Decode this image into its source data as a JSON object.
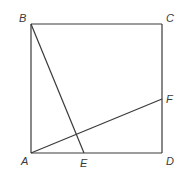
{
  "diagram": {
    "type": "geometry",
    "shape": "square",
    "stroke_color": "#3a3a3a",
    "background": "#ffffff",
    "points": {
      "A": {
        "label": "A",
        "x": 31,
        "y": 153,
        "label_x": 21,
        "label_y": 165
      },
      "B": {
        "label": "B",
        "x": 31,
        "y": 24,
        "label_x": 19,
        "label_y": 22
      },
      "C": {
        "label": "C",
        "x": 162,
        "y": 24,
        "label_x": 166,
        "label_y": 22
      },
      "D": {
        "label": "D",
        "x": 162,
        "y": 153,
        "label_x": 166,
        "label_y": 165
      },
      "E": {
        "label": "E",
        "x": 84,
        "y": 153,
        "label_x": 80,
        "label_y": 167
      },
      "F": {
        "label": "F",
        "x": 162,
        "y": 99,
        "label_x": 166,
        "label_y": 103
      }
    },
    "segments": [
      {
        "from": "A",
        "to": "B"
      },
      {
        "from": "B",
        "to": "C"
      },
      {
        "from": "C",
        "to": "D"
      },
      {
        "from": "D",
        "to": "A"
      },
      {
        "from": "B",
        "to": "E"
      },
      {
        "from": "A",
        "to": "F"
      }
    ]
  }
}
